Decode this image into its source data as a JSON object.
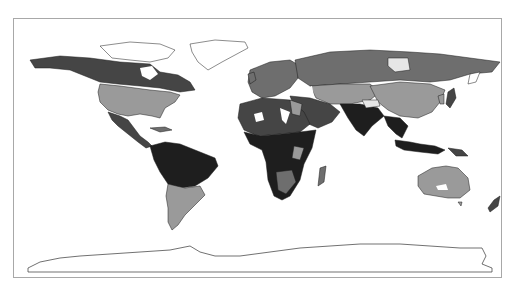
{
  "map": {
    "type": "choropleth",
    "projection": "equirectangular",
    "frame_color": "#a8a8a8",
    "background": "#ffffff",
    "palette": {
      "light": "#e6e6e6",
      "mid": "#9a9a9a",
      "midDark": "#6e6e6e",
      "dark": "#454545",
      "darkest": "#1e1e1e",
      "none": "#ffffff"
    },
    "regions": [
      {
        "name": "greenland",
        "shade": "none"
      },
      {
        "name": "canada-arctic",
        "shade": "none"
      },
      {
        "name": "alaska-canada-north",
        "shade": "dark"
      },
      {
        "name": "usa",
        "shade": "mid"
      },
      {
        "name": "mexico-central-america",
        "shade": "dark"
      },
      {
        "name": "south-america-north",
        "shade": "darkest"
      },
      {
        "name": "south-america-south",
        "shade": "mid"
      },
      {
        "name": "europe",
        "shade": "midDark"
      },
      {
        "name": "russia",
        "shade": "midDark"
      },
      {
        "name": "siberia-patch",
        "shade": "light"
      },
      {
        "name": "central-asia",
        "shade": "mid"
      },
      {
        "name": "china",
        "shade": "mid"
      },
      {
        "name": "south-asia",
        "shade": "darkest"
      },
      {
        "name": "southeast-asia",
        "shade": "darkest"
      },
      {
        "name": "middle-east",
        "shade": "dark"
      },
      {
        "name": "north-africa",
        "shade": "dark"
      },
      {
        "name": "sub-saharan-africa",
        "shade": "darkest"
      },
      {
        "name": "madagascar",
        "shade": "midDark"
      },
      {
        "name": "australia",
        "shade": "mid"
      },
      {
        "name": "new-zealand",
        "shade": "dark"
      },
      {
        "name": "japan",
        "shade": "dark"
      },
      {
        "name": "antarctica",
        "shade": "none"
      }
    ]
  }
}
